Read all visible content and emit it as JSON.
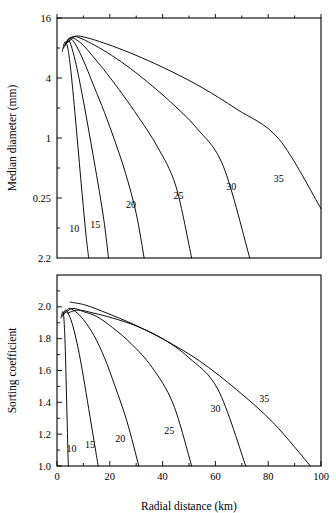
{
  "figure": {
    "xlabel": "Radial distance (km)",
    "panels": [
      "upper",
      "lower"
    ]
  },
  "chart_data": [
    {
      "type": "line",
      "panel": "upper",
      "title": "",
      "xlabel": "Radial distance (km)",
      "ylabel": "Median diameter (mm)",
      "xlim": [
        0,
        100
      ],
      "ylim": [
        0.0625,
        16
      ],
      "yscale": "log2",
      "xscale": "linear",
      "grid": false,
      "legend": "inline-curve-labels",
      "xticks": [
        0,
        20,
        40,
        60,
        80,
        100
      ],
      "xticklabels": [
        "0",
        "20",
        "40",
        "60",
        "80",
        "100"
      ],
      "xminorticks": [
        10,
        30,
        50,
        70,
        90
      ],
      "yticks": [
        16,
        4,
        1,
        0.25
      ],
      "yticklabels": [
        "16",
        "4",
        "1",
        "0.25"
      ],
      "series": [
        {
          "name": "10",
          "label": "10",
          "label_x": 6.5,
          "label_y": 0.115,
          "x": [
            2.0,
            3.0,
            4.0,
            5.0,
            6.0,
            7.0,
            8.0,
            9.0,
            10.0,
            11.0,
            12.0
          ],
          "y": [
            7.4,
            9.2,
            8.2,
            5.4,
            3.0,
            1.55,
            0.78,
            0.39,
            0.2,
            0.105,
            0.0625
          ]
        },
        {
          "name": "15",
          "label": "15",
          "label_x": 14.5,
          "label_y": 0.125,
          "x": [
            2.5,
            4.0,
            5.0,
            6.5,
            8.0,
            10.0,
            12.0,
            14.0,
            16.0,
            18.0,
            19.5
          ],
          "y": [
            8.0,
            9.6,
            9.0,
            6.6,
            4.4,
            2.35,
            1.2,
            0.6,
            0.295,
            0.135,
            0.0625
          ]
        },
        {
          "name": "20",
          "label": "20",
          "label_x": 28.0,
          "label_y": 0.2,
          "x": [
            3.0,
            4.5,
            6.0,
            8.0,
            11.0,
            14.0,
            18.0,
            22.0,
            26.0,
            30.0,
            33.0
          ],
          "y": [
            8.4,
            10.0,
            9.5,
            7.8,
            5.2,
            3.3,
            1.8,
            0.92,
            0.44,
            0.175,
            0.0625
          ]
        },
        {
          "name": "25",
          "label": "25",
          "label_x": 46.0,
          "label_y": 0.245,
          "x": [
            3.5,
            5.0,
            7.0,
            10.0,
            14.0,
            19.0,
            25.0,
            31.0,
            38.0,
            45.0,
            51.0
          ],
          "y": [
            8.8,
            10.2,
            9.8,
            8.5,
            6.4,
            4.4,
            2.7,
            1.6,
            0.82,
            0.33,
            0.0625
          ]
        },
        {
          "name": "30",
          "label": "30",
          "label_x": 66.0,
          "label_y": 0.3,
          "x": [
            4.0,
            6.0,
            9.0,
            13.0,
            19.0,
            26.0,
            34.0,
            43.0,
            53.0,
            63.0,
            73.0
          ],
          "y": [
            9.0,
            10.4,
            10.0,
            8.9,
            7.2,
            5.4,
            3.7,
            2.3,
            1.25,
            0.52,
            0.0625
          ]
        },
        {
          "name": "35",
          "label": "35",
          "label_x": 84.0,
          "label_y": 0.36,
          "x": [
            4.5,
            7.0,
            11.0,
            16.0,
            23.0,
            32.0,
            43.0,
            55.0,
            68.0,
            84.0,
            100.0
          ],
          "y": [
            9.2,
            10.5,
            10.2,
            9.3,
            8.0,
            6.4,
            4.7,
            3.2,
            1.95,
            0.98,
            0.195
          ]
        }
      ]
    },
    {
      "type": "line",
      "panel": "lower",
      "title": "",
      "xlabel": "Radial distance (km)",
      "ylabel": "Sorting coefficient",
      "xlim": [
        0,
        100
      ],
      "ylim": [
        1.0,
        2.2
      ],
      "yscale": "linear",
      "xscale": "linear",
      "grid": false,
      "legend": "inline-curve-labels",
      "xticks": [
        0,
        20,
        40,
        60,
        80,
        100
      ],
      "xticklabels": [
        "0",
        "20",
        "40",
        "60",
        "80",
        "100"
      ],
      "xminorticks": [
        10,
        30,
        50,
        70,
        90
      ],
      "yticks": [
        1.0,
        1.2,
        1.4,
        1.6,
        1.8,
        2.0,
        2.2
      ],
      "yticklabels": [
        "1.0",
        "1.2",
        "1.4",
        "1.6",
        "1.8",
        "2.0",
        "2.2"
      ],
      "series": [
        {
          "name": "10",
          "label": "10",
          "label_x": 5.5,
          "label_y": 1.09,
          "x": [
            1.5,
            2.2,
            2.6,
            3.0,
            3.3,
            3.6,
            3.9,
            4.1,
            4.3
          ],
          "y": [
            1.93,
            1.97,
            1.93,
            1.8,
            1.64,
            1.44,
            1.25,
            1.11,
            1.0
          ]
        },
        {
          "name": "15",
          "label": "15",
          "label_x": 12.5,
          "label_y": 1.11,
          "x": [
            2.0,
            3.2,
            4.5,
            6.0,
            8.0,
            10.0,
            12.0,
            14.0,
            15.6
          ],
          "y": [
            1.94,
            1.98,
            1.95,
            1.88,
            1.74,
            1.56,
            1.36,
            1.16,
            1.0
          ]
        },
        {
          "name": "20",
          "label": "20",
          "label_x": 24.0,
          "label_y": 1.15,
          "x": [
            2.5,
            4.5,
            7.0,
            10.0,
            14.0,
            18.0,
            22.0,
            26.5,
            31.0
          ],
          "y": [
            1.95,
            1.99,
            1.97,
            1.92,
            1.82,
            1.68,
            1.5,
            1.28,
            1.0
          ]
        },
        {
          "name": "25",
          "label": "25",
          "label_x": 42.5,
          "label_y": 1.2,
          "x": [
            3.0,
            6.0,
            10.0,
            15.0,
            21.0,
            28.0,
            36.0,
            44.0,
            51.0
          ],
          "y": [
            1.96,
            1.99,
            1.97,
            1.94,
            1.87,
            1.77,
            1.62,
            1.39,
            1.0
          ]
        },
        {
          "name": "30",
          "label": "30",
          "label_x": 60.0,
          "label_y": 1.34,
          "x": [
            4.0,
            8.0,
            14.0,
            21.0,
            30.0,
            40.0,
            50.0,
            61.0,
            71.5
          ],
          "y": [
            1.96,
            1.98,
            1.96,
            1.93,
            1.88,
            1.8,
            1.68,
            1.48,
            1.0
          ]
        },
        {
          "name": "35",
          "label": "35",
          "label_x": 78.5,
          "label_y": 1.4,
          "x": [
            5.0,
            11.0,
            19.0,
            29.0,
            41.0,
            54.0,
            68.0,
            82.0,
            96.0
          ],
          "y": [
            2.03,
            2.01,
            1.96,
            1.89,
            1.79,
            1.66,
            1.48,
            1.27,
            1.0
          ]
        }
      ]
    }
  ]
}
